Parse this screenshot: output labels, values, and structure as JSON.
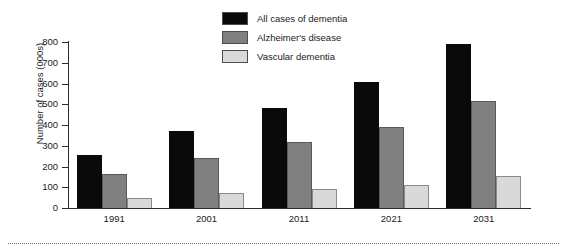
{
  "chart_data": {
    "type": "bar",
    "title": "",
    "xlabel": "",
    "ylabel": "Number of cases (000s)",
    "categories": [
      "1991",
      "2001",
      "2011",
      "2021",
      "2031"
    ],
    "series": [
      {
        "name": "All cases of dementia",
        "color": "#0a0a0a",
        "values": [
          255,
          370,
          480,
          605,
          790
        ]
      },
      {
        "name": "Alzheimer's disease",
        "color": "#808080",
        "values": [
          165,
          240,
          320,
          390,
          515
        ]
      },
      {
        "name": "Vascular dementia",
        "color": "#d9d9d9",
        "values": [
          50,
          70,
          90,
          110,
          155
        ]
      }
    ],
    "ylim": [
      0,
      800
    ],
    "ytick_values": [
      0,
      100,
      200,
      300,
      400,
      500,
      600,
      700,
      800
    ],
    "ytick_labels": [
      "0",
      "100",
      "200",
      "300",
      "400",
      "500",
      "600",
      "700",
      "800"
    ],
    "grid": false,
    "legend_position": "top-center"
  },
  "legend": {
    "items": [
      {
        "label": "All cases of dementia",
        "swatch": "#0a0a0a"
      },
      {
        "label": "Alzheimer's disease",
        "swatch": "#808080"
      },
      {
        "label": "Vascular dementia",
        "swatch": "#d9d9d9"
      }
    ]
  }
}
